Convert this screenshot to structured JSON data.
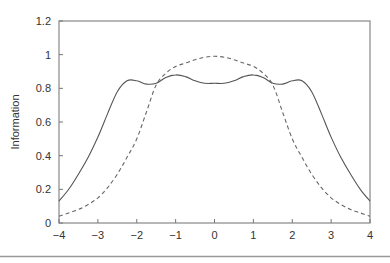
{
  "chart_data": {
    "type": "line",
    "title": "",
    "xlabel": "",
    "ylabel": "Information",
    "xlim": [
      -4,
      4
    ],
    "ylim": [
      0,
      1.2
    ],
    "x_ticks": [
      -4,
      -3,
      -2,
      -1,
      0,
      1,
      2,
      3,
      4
    ],
    "x_tick_labels": [
      "−4",
      "−3",
      "−2",
      "−1",
      "0",
      "1",
      "2",
      "3",
      "4"
    ],
    "y_ticks": [
      0,
      0.2,
      0.4,
      0.6,
      0.8,
      1,
      1.2
    ],
    "y_tick_labels": [
      "0",
      "0.2",
      "0.4",
      "0.6",
      "0.8",
      "1",
      "1.2"
    ],
    "grid": false,
    "legend": null,
    "series": [
      {
        "name": "solid",
        "style": "solid",
        "color": "#555555",
        "x": [
          -4,
          -3.75,
          -3.5,
          -3.25,
          -3,
          -2.75,
          -2.5,
          -2.25,
          -2,
          -1.75,
          -1.5,
          -1.25,
          -1,
          -0.75,
          -0.5,
          -0.25,
          0,
          0.25,
          0.5,
          0.75,
          1,
          1.25,
          1.5,
          1.75,
          2,
          2.25,
          2.5,
          2.75,
          3,
          3.25,
          3.5,
          3.75,
          4
        ],
        "y": [
          0.13,
          0.2,
          0.29,
          0.39,
          0.51,
          0.65,
          0.78,
          0.845,
          0.845,
          0.825,
          0.83,
          0.865,
          0.88,
          0.87,
          0.845,
          0.83,
          0.83,
          0.83,
          0.845,
          0.87,
          0.88,
          0.865,
          0.83,
          0.825,
          0.845,
          0.845,
          0.78,
          0.65,
          0.51,
          0.39,
          0.29,
          0.2,
          0.13
        ]
      },
      {
        "name": "dashed",
        "style": "dashed",
        "color": "#666666",
        "x": [
          -4,
          -3.75,
          -3.5,
          -3.25,
          -3,
          -2.75,
          -2.5,
          -2.25,
          -2,
          -1.75,
          -1.5,
          -1.25,
          -1,
          -0.75,
          -0.5,
          -0.25,
          0,
          0.25,
          0.5,
          0.75,
          1,
          1.25,
          1.5,
          1.75,
          2,
          2.25,
          2.5,
          2.75,
          3,
          3.25,
          3.5,
          3.75,
          4
        ],
        "y": [
          0.04,
          0.06,
          0.08,
          0.11,
          0.15,
          0.21,
          0.29,
          0.39,
          0.5,
          0.66,
          0.82,
          0.89,
          0.93,
          0.95,
          0.97,
          0.985,
          0.99,
          0.985,
          0.97,
          0.95,
          0.93,
          0.89,
          0.82,
          0.66,
          0.5,
          0.39,
          0.29,
          0.21,
          0.15,
          0.11,
          0.08,
          0.06,
          0.04
        ]
      }
    ]
  }
}
